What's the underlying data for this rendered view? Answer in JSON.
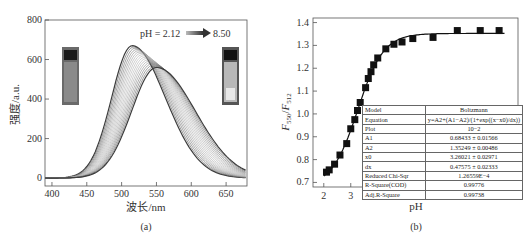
{
  "chart_data": [
    {
      "type": "line",
      "panel_label": "(a)",
      "title": "",
      "xlabel": "波长/nm",
      "ylabel": "强度/a.u.",
      "xlim": [
        390,
        680
      ],
      "ylim": [
        -40,
        800
      ],
      "xticks": [
        "400",
        "450",
        "500",
        "550",
        "600",
        "650"
      ],
      "yticks": [
        "0",
        "200",
        "400",
        "600",
        "800"
      ],
      "annotation": {
        "start": "pH = 2.12",
        "end": "8.50"
      },
      "grid": false,
      "series_description": "Family of fluorescence emission spectra as pH increases from 2.12 to 8.50; peak shifts from ~515 nm (~670 a.u.) to ~550 nm (~560 a.u.)",
      "series": [
        {
          "name": "pH 2.12",
          "peak_x": 515,
          "peak_y": 670
        },
        {
          "name": "pH 8.50",
          "peak_x": 550,
          "peak_y": 560
        }
      ]
    },
    {
      "type": "scatter",
      "panel_label": "(b)",
      "title": "",
      "xlabel": "pH",
      "ylabel": "F550/F512",
      "xlim": [
        1.6,
        9.2
      ],
      "ylim": [
        0.68,
        1.42
      ],
      "xticks": [
        "2",
        "3",
        "4",
        "5",
        "6",
        "7",
        "8",
        "9"
      ],
      "yticks": [
        "0.7",
        "0.8",
        "0.9",
        "1.0",
        "1.1",
        "1.2",
        "1.3",
        "1.4"
      ],
      "grid": false,
      "x": [
        2.1,
        2.2,
        2.4,
        2.6,
        2.85,
        3.0,
        3.15,
        3.25,
        3.35,
        3.55,
        3.65,
        3.75,
        3.85,
        4.0,
        4.3,
        4.6,
        4.9,
        5.3,
        6.05,
        6.95,
        7.8,
        8.5
      ],
      "values": [
        0.745,
        0.755,
        0.78,
        0.82,
        0.87,
        0.935,
        0.975,
        1.015,
        1.05,
        1.115,
        1.155,
        1.185,
        1.215,
        1.245,
        1.285,
        1.305,
        1.315,
        1.33,
        1.335,
        1.365,
        1.365,
        1.365
      ],
      "fit": {
        "model": "Boltzmann",
        "A1": 0.68433,
        "A2": 1.35249,
        "x0": 3.26021,
        "dx": 0.47575
      }
    }
  ],
  "panel_a": {
    "y_axis_label": "强度/a.u.",
    "x_axis_label": "波长/nm",
    "caption": "(a)",
    "ph_start": "pH = 2.12",
    "ph_end": "8.50",
    "yticks": [
      "0",
      "200",
      "400",
      "600",
      "800"
    ],
    "xticks": [
      "400",
      "450",
      "500",
      "550",
      "600",
      "650"
    ]
  },
  "panel_b": {
    "y_axis_main": "F",
    "y_sub_1": "550",
    "y_sep": "/",
    "y_sub_2": "512",
    "x_axis_label": "pH",
    "caption": "(b)",
    "yticks": [
      "0.7",
      "0.8",
      "0.9",
      "1.0",
      "1.1",
      "1.2",
      "1.3",
      "1.4"
    ],
    "xticks": [
      "2",
      "3",
      "4",
      "5",
      "6",
      "7",
      "8",
      "9"
    ],
    "fit_table": [
      {
        "key": "Model",
        "value": "Boltzmann"
      },
      {
        "key": "Equation",
        "value": "y=A2+(A1−A2)/(1+exp((x−x0)/dx))"
      },
      {
        "key": "Plot",
        "value": "10−2"
      },
      {
        "key": "A1",
        "value": "0.68433 ± 0.01566"
      },
      {
        "key": "A2",
        "value": "1.35249 ± 0.00486"
      },
      {
        "key": "x0",
        "value": "3.26021 ± 0.02971"
      },
      {
        "key": "dx",
        "value": "0.47575 ± 0.02333"
      },
      {
        "key": "Reduced Chi-Sqr",
        "value": "1.26559E−4"
      },
      {
        "key": "R-Square(COD)",
        "value": "0.99776"
      },
      {
        "key": "Adj.R-Square",
        "value": "0.99738"
      }
    ]
  }
}
